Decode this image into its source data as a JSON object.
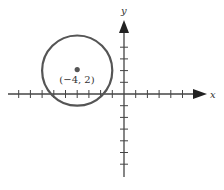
{
  "diagram": {
    "type": "coordinate-plane-circle",
    "axes": {
      "x_label": "x",
      "y_label": "y",
      "origin_px": [
        124,
        94
      ],
      "unit_px": 11.7,
      "x_ticks": [
        -9,
        -8,
        -7,
        -6,
        -5,
        -4,
        -3,
        -2,
        -1,
        1,
        2,
        3,
        4,
        5,
        6
      ],
      "y_ticks": [
        4,
        3,
        2,
        1,
        -1,
        -2,
        -3,
        -4,
        -5,
        -6
      ],
      "color": "#444444"
    },
    "circle": {
      "center": [
        -4,
        2
      ],
      "radius": 3,
      "color": "#555555"
    },
    "center_point": {
      "label": "(−4, 2)",
      "color": "#555555"
    }
  }
}
